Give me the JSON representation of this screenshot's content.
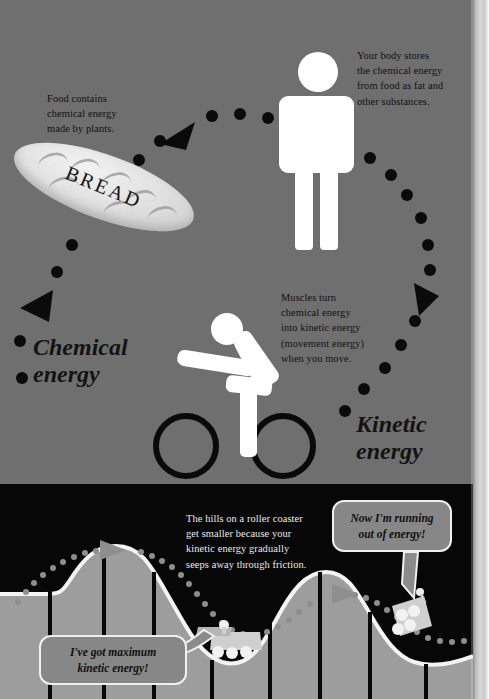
{
  "page": {
    "background_top": "#6f6f6f",
    "background_bottom": "#070707",
    "accent_white": "#ffffff",
    "text_dark": "#14100f",
    "text_light": "#e9e9e9"
  },
  "captions": {
    "food": "Food contains\nchemical energy\nmade by plants.",
    "body": "Your body stores\nthe chemical energy\nfrom food as fat and\nother substances.",
    "muscles": "Muscles turn\nchemical energy\ninto kinetic energy\n(movement energy)\nwhen you move.",
    "hills": "The hills on a roller coaster\nget smaller because your\nkinetic energy gradually\nseeps away through friction."
  },
  "labels": {
    "chemical": "Chemical\nenergy",
    "kinetic": "Kinetic\nenergy",
    "bread": "BREAD"
  },
  "bubbles": {
    "right": "Now I'm running\nout of energy!",
    "left": "I've got maximum\nkinetic energy!"
  },
  "figures": {
    "standing_person": "standing-person-pictogram",
    "cyclist": "cyclist-pictogram",
    "bread_loaf": "bread-loaf-illustration",
    "coaster_car_1": "roller-coaster-car-front",
    "coaster_car_2": "roller-coaster-car-rear"
  },
  "flow": {
    "direction": "clockwise energy cycle",
    "arrow_count": 3,
    "arrows": [
      "arrow-left-top",
      "arrow-left-bottom",
      "arrow-right"
    ],
    "trail_style": "dotted"
  },
  "coaster": {
    "hill_heights_relative": [
      100,
      62,
      30
    ],
    "note": "hills get progressively smaller"
  }
}
